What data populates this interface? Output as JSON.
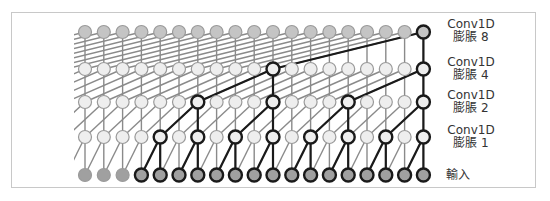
{
  "diagram": {
    "node_count_per_row": 19,
    "layers": [
      {
        "id": "dil8",
        "line1": "Conv1D",
        "line2": "膨脹 8",
        "dilation": 8,
        "highlight": [
          18
        ]
      },
      {
        "id": "dil4",
        "line1": "Conv1D",
        "line2": "膨脹 4",
        "dilation": 4,
        "highlight": [
          10,
          18
        ]
      },
      {
        "id": "dil2",
        "line1": "Conv1D",
        "line2": "膨脹 2",
        "dilation": 2,
        "highlight": [
          6,
          10,
          14,
          18
        ]
      },
      {
        "id": "dil1",
        "line1": "Conv1D",
        "line2": "膨脹 1",
        "dilation": 1,
        "highlight": [
          4,
          6,
          8,
          10,
          12,
          14,
          16,
          18
        ]
      },
      {
        "id": "input",
        "line1": "輸入",
        "line2": "",
        "dilation": 0,
        "highlight": [
          3,
          4,
          5,
          6,
          7,
          8,
          9,
          10,
          11,
          12,
          13,
          14,
          15,
          16,
          17,
          18
        ]
      }
    ],
    "colors": {
      "frame": "#c8c8c8",
      "edge_gray": "#8a8a8a",
      "edge_dark": "#1a1a1a",
      "node_top_fill": "#c4c4c4",
      "node_mid_fill": "#eeeeee",
      "node_input_fill": "#a0a0a0",
      "node_gray_stroke": "#9a9a9a",
      "node_dark_stroke": "#1a1a1a"
    }
  }
}
